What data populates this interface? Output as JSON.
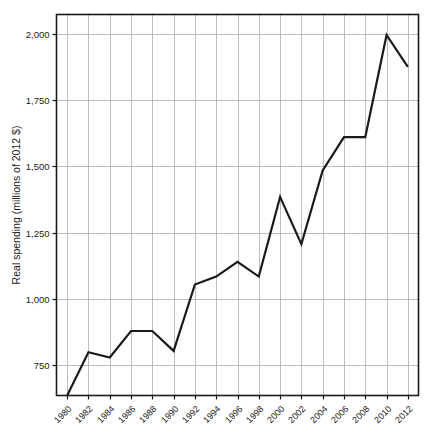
{
  "chart_data": {
    "type": "line",
    "title": "",
    "xlabel": "",
    "ylabel": "Real spending (millions of 2012 $)",
    "x": [
      1980,
      1982,
      1984,
      1986,
      1988,
      1990,
      1992,
      1994,
      1996,
      1998,
      2000,
      2002,
      2004,
      2006,
      2008,
      2010,
      2012
    ],
    "values": [
      637,
      800,
      780,
      880,
      880,
      805,
      1055,
      1085,
      1140,
      1085,
      1385,
      1207,
      1485,
      1610,
      1610,
      1995,
      1875
    ],
    "series": [
      {
        "name": "Real spending",
        "values": [
          637,
          800,
          780,
          880,
          880,
          805,
          1055,
          1085,
          1140,
          1085,
          1385,
          1207,
          1485,
          1610,
          1610,
          1995,
          1875
        ]
      }
    ],
    "xlim": [
      1979,
      2013
    ],
    "ylim": [
      637,
      2072
    ],
    "xticks": [
      1980,
      1982,
      1984,
      1986,
      1988,
      1990,
      1992,
      1994,
      1996,
      1998,
      2000,
      2002,
      2004,
      2006,
      2008,
      2010,
      2012
    ],
    "xtick_labels": [
      "1980",
      "1982",
      "1984",
      "1986",
      "1988",
      "1990",
      "1992",
      "1994",
      "1996",
      "1998",
      "2000",
      "2002",
      "2004",
      "2006",
      "2008",
      "2010",
      "2012"
    ],
    "yticks": [
      750,
      1000,
      1250,
      1500,
      1750,
      2000
    ],
    "ytick_labels": [
      "750",
      "1,000",
      "1,250",
      "1,500",
      "1,750",
      "2,000"
    ],
    "grid": true,
    "grid_axes": "both",
    "legend": "none",
    "line_color": "#1a1a1a",
    "grid_color": "#b5b5b5",
    "frame_color": "#1a1a1a",
    "background": "#ffffff",
    "annotations": []
  }
}
